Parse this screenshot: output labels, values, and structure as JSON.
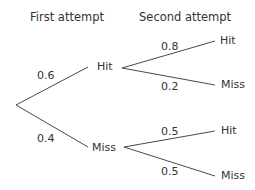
{
  "headers": {
    "first": "First attempt",
    "second": "Second attempt"
  },
  "tree": {
    "first": [
      {
        "outcome": "Hit",
        "probability": "0.6",
        "second": [
          {
            "outcome": "Hit",
            "probability": "0.8"
          },
          {
            "outcome": "Miss",
            "probability": "0.2"
          }
        ]
      },
      {
        "outcome": "Miss",
        "probability": "0.4",
        "second": [
          {
            "outcome": "Hit",
            "probability": "0.5"
          },
          {
            "outcome": "Miss",
            "probability": "0.5"
          }
        ]
      }
    ]
  }
}
